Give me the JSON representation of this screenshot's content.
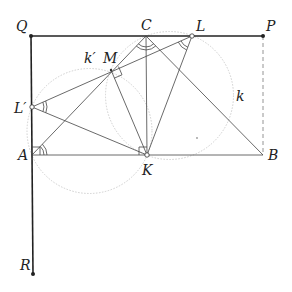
{
  "diagram": {
    "title": "",
    "points": {
      "Q": {
        "label": "Q",
        "x": 31,
        "y": 36,
        "lx": 16,
        "ly": 31
      },
      "C": {
        "label": "C",
        "x": 146,
        "y": 36,
        "lx": 141,
        "ly": 30
      },
      "L": {
        "label": "L",
        "x": 192,
        "y": 36,
        "lx": 196,
        "ly": 31
      },
      "P": {
        "label": "P",
        "x": 263,
        "y": 36,
        "lx": 266,
        "ly": 31
      },
      "M": {
        "label": "M",
        "x": 111,
        "y": 70,
        "lx": 103,
        "ly": 63
      },
      "Lp": {
        "label": "L′",
        "x": 32,
        "y": 107,
        "lx": 14,
        "ly": 113
      },
      "A": {
        "label": "A",
        "x": 32,
        "y": 155,
        "lx": 18,
        "ly": 160
      },
      "K": {
        "label": "K",
        "x": 147,
        "y": 155,
        "lx": 142,
        "ly": 175
      },
      "B": {
        "label": "B",
        "x": 263,
        "y": 155,
        "lx": 268,
        "ly": 160
      },
      "R": {
        "label": "R",
        "x": 33,
        "y": 274,
        "lx": 20,
        "ly": 270
      }
    },
    "circles": {
      "k": {
        "label": "k",
        "cx": 169.5,
        "cy": 95.5,
        "r": 64,
        "lx": 236,
        "ly": 101
      },
      "kp": {
        "label": "k′",
        "cx": 89.5,
        "cy": 131,
        "r": 62.5,
        "lx": 85,
        "ly": 63
      }
    },
    "colors": {
      "thick": "#222222",
      "thin": "#444444",
      "circle": "#c8c8c8",
      "dashed": "#888888"
    }
  }
}
